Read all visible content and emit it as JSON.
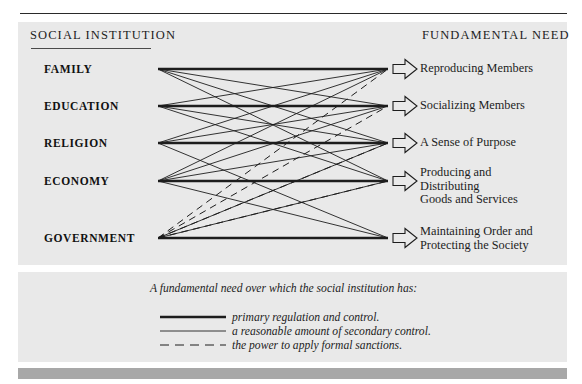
{
  "figure": {
    "background_color": "#ffffff",
    "panel_color": "#e9e9e9",
    "rule_color": "#2a2a2a",
    "bottom_bar_color": "#a8a8a8",
    "ink_color": "#1d1d1d"
  },
  "headers": {
    "left": "SOCIAL  INSTITUTION",
    "right": "FUNDAMENTAL  NEED"
  },
  "institutions": [
    {
      "id": "family",
      "label": "FAMILY",
      "y": 69
    },
    {
      "id": "education",
      "label": "EDUCATION",
      "y": 106
    },
    {
      "id": "religion",
      "label": "RELIGION",
      "y": 143
    },
    {
      "id": "economy",
      "label": "ECONOMY",
      "y": 181
    },
    {
      "id": "government",
      "label": "GOVERNMENT",
      "y": 238
    }
  ],
  "needs": [
    {
      "id": "reproducing",
      "label": "Reproducing Members",
      "y": 69
    },
    {
      "id": "socializing",
      "label": "Socializing Members",
      "y": 106
    },
    {
      "id": "purpose",
      "label": "A Sense of Purpose",
      "y": 143
    },
    {
      "id": "producing",
      "label": "Producing and\nDistributing\nGoods and Services",
      "y": 186
    },
    {
      "id": "order",
      "label": "Maintaining Order and\nProtecting the Society",
      "y": 238
    }
  ],
  "legend": {
    "title": "A fundamental need over which the social institution has:",
    "items": [
      {
        "id": "primary",
        "style": "thick-solid",
        "label": "primary regulation and control.",
        "y": 317
      },
      {
        "id": "secondary",
        "style": "thin-solid",
        "label": "a reasonable amount of secondary control.",
        "y": 331
      },
      {
        "id": "sanctions",
        "style": "dashed",
        "label": "the power to apply formal sanctions.",
        "y": 345
      }
    ]
  },
  "chart_data": {
    "type": "diagram",
    "x_left": 158,
    "x_right": 388,
    "link_styles": {
      "thick-solid": {
        "width": 2.6,
        "dash": "none",
        "meaning": "primary regulation and control."
      },
      "thin-solid": {
        "width": 0.9,
        "dash": "none",
        "meaning": "a reasonable amount of secondary control."
      },
      "dashed": {
        "width": 1.0,
        "dash": "7,5",
        "meaning": "the power to apply formal sanctions."
      }
    },
    "links": [
      {
        "from": "family",
        "to": "reproducing",
        "style": "thick-solid"
      },
      {
        "from": "family",
        "to": "socializing",
        "style": "thin-solid"
      },
      {
        "from": "family",
        "to": "purpose",
        "style": "thin-solid"
      },
      {
        "from": "family",
        "to": "producing",
        "style": "thin-solid"
      },
      {
        "from": "education",
        "to": "socializing",
        "style": "thick-solid"
      },
      {
        "from": "education",
        "to": "reproducing",
        "style": "thin-solid"
      },
      {
        "from": "education",
        "to": "purpose",
        "style": "thin-solid"
      },
      {
        "from": "education",
        "to": "producing",
        "style": "thin-solid"
      },
      {
        "from": "religion",
        "to": "purpose",
        "style": "thick-solid"
      },
      {
        "from": "religion",
        "to": "reproducing",
        "style": "thin-solid"
      },
      {
        "from": "religion",
        "to": "socializing",
        "style": "thin-solid"
      },
      {
        "from": "religion",
        "to": "order",
        "style": "thin-solid"
      },
      {
        "from": "economy",
        "to": "producing",
        "style": "thick-solid"
      },
      {
        "from": "economy",
        "to": "reproducing",
        "style": "thin-solid"
      },
      {
        "from": "economy",
        "to": "socializing",
        "style": "thin-solid"
      },
      {
        "from": "economy",
        "to": "purpose",
        "style": "thin-solid"
      },
      {
        "from": "economy",
        "to": "order",
        "style": "thin-solid"
      },
      {
        "from": "government",
        "to": "order",
        "style": "thick-solid"
      },
      {
        "from": "government",
        "to": "order",
        "style": "dashed"
      },
      {
        "from": "government",
        "to": "reproducing",
        "style": "dashed"
      },
      {
        "from": "government",
        "to": "socializing",
        "style": "dashed"
      },
      {
        "from": "government",
        "to": "purpose",
        "style": "dashed"
      },
      {
        "from": "government",
        "to": "producing",
        "style": "dashed"
      },
      {
        "from": "government",
        "to": "producing",
        "style": "thin-solid"
      },
      {
        "from": "government",
        "to": "purpose",
        "style": "thin-solid"
      }
    ]
  }
}
